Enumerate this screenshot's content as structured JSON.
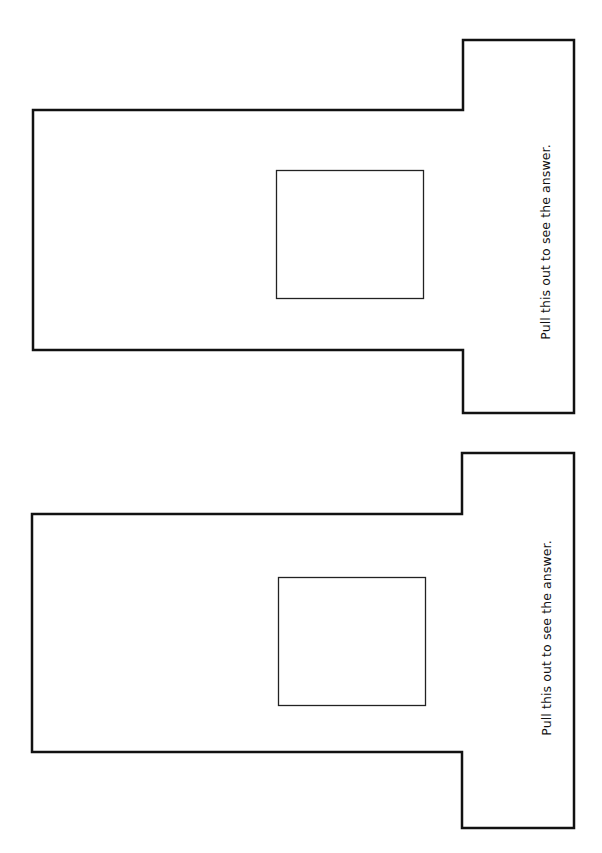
{
  "page": {
    "background": "#ffffff",
    "stroke_color": "#111111"
  },
  "cutouts": [
    {
      "id": "top",
      "tab_label": "Pull this out to see the answer."
    },
    {
      "id": "bottom",
      "tab_label": "Pull this out to see the answer."
    }
  ]
}
